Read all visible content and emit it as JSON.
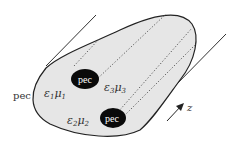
{
  "diagram": {
    "outer_label": "pec",
    "regions": [
      {
        "id": "region-1",
        "eps": "ε",
        "eps_sub": "1",
        "mu": "μ",
        "mu_sub": "1"
      },
      {
        "id": "region-2",
        "eps": "ε",
        "eps_sub": "2",
        "mu": "μ",
        "mu_sub": "2"
      },
      {
        "id": "region-3",
        "eps": "ε",
        "eps_sub": "3",
        "mu": "μ",
        "mu_sub": "3"
      }
    ],
    "conductors": [
      {
        "id": "conductor-upper",
        "label": "pec"
      },
      {
        "id": "conductor-lower",
        "label": "pec"
      }
    ],
    "axis_label": "z",
    "colors": {
      "fill": "#e6e6e6",
      "outline": "#222222",
      "conductor": "#0a0a0a",
      "dotted": "#555555"
    }
  }
}
